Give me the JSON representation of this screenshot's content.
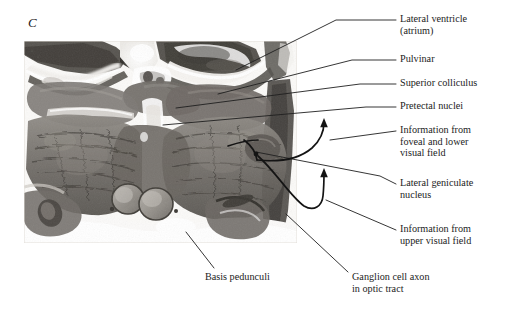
{
  "figure": {
    "panel_letter": "C",
    "type": "anatomical photomicrograph with labels",
    "modality": "coronal histological section, human brain, midbrain/thalamus level",
    "colors": {
      "line": "#1f1f1f",
      "text": "#1c1c1c",
      "photo_light": "#ffffff",
      "photo_mid": "#9a9690",
      "photo_dark": "#3b3833"
    }
  },
  "labels": [
    {
      "id": "lateral-ventricle",
      "line1": "Lateral ventricle",
      "line2": "(atrium)",
      "text": "Lateral ventricle\n(atrium)"
    },
    {
      "id": "pulvinar",
      "line1": "Pulvinar",
      "line2": "",
      "text": "Pulvinar"
    },
    {
      "id": "superior-colliculus",
      "line1": "Superior colliculus",
      "line2": "",
      "text": "Superior colliculus"
    },
    {
      "id": "pretectal-nuclei",
      "line1": "Pretectal nuclei",
      "line2": "",
      "text": "Pretectal nuclei"
    },
    {
      "id": "information-foveal-lower",
      "line1": "Information from",
      "line2": "foveal and lower",
      "line3": "visual field",
      "text": "Information from\nfoveal and lower\nvisual field"
    },
    {
      "id": "lateral-geniculate-nucleus",
      "line1": "Lateral geniculate",
      "line2": "nucleus",
      "text": "Lateral geniculate\nnucleus"
    },
    {
      "id": "information-upper",
      "line1": "Information from",
      "line2": "upper visual field",
      "text": "Information from\nupper visual field"
    },
    {
      "id": "basis-pedunculi",
      "line1": "Basis pedunculi",
      "line2": "",
      "text": "Basis pedunculi"
    },
    {
      "id": "ganglion-cell-axon",
      "line1": "Ganglion cell axon",
      "line2": "in optic tract",
      "text": "Ganglion cell axon\nin optic tract"
    }
  ]
}
